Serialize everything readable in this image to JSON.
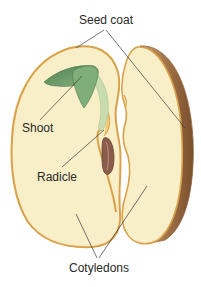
{
  "diagram": {
    "labels": {
      "seed_coat": "Seed coat",
      "shoot": "Shoot",
      "radicle": "Radicle",
      "cotyledons": "Cotyledons"
    },
    "colors": {
      "background": "#ffffff",
      "cotyledon_fill": "#f8eec8",
      "seed_coat_outline": "#d9a24a",
      "seed_coat_side": "#9a6a40",
      "shoot_leaf": "#6f9e6a",
      "shoot_stem": "#c9dcb0",
      "radicle": "#8a5d4a",
      "leader_line": "#3a3a3a",
      "label_text": "#2a2a2a"
    }
  }
}
